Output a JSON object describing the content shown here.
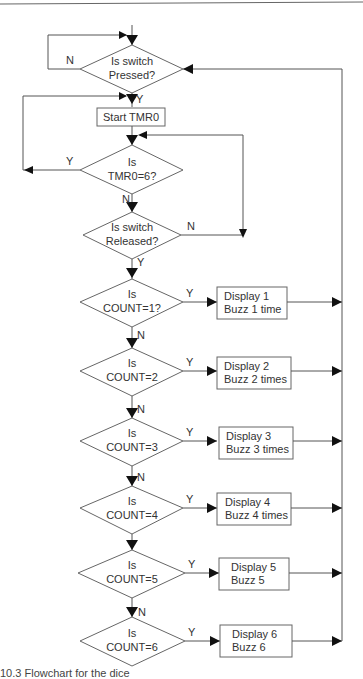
{
  "diagram": {
    "type": "flowchart",
    "nodes": {
      "pressed": {
        "line1": "Is switch",
        "line2": "Pressed?"
      },
      "start_tmr": {
        "label": "Start TMR0"
      },
      "tmr_check": {
        "line1": "Is",
        "line2": "TMR0=6?"
      },
      "released": {
        "line1": "Is switch",
        "line2": "Released?"
      },
      "count1": {
        "line1": "Is",
        "line2": "COUNT=1?"
      },
      "count2": {
        "line1": "Is",
        "line2": "COUNT=2"
      },
      "count3": {
        "line1": "Is",
        "line2": "COUNT=3"
      },
      "count4": {
        "line1": "Is",
        "line2": "COUNT=4"
      },
      "count5": {
        "line1": "Is",
        "line2": "COUNT=5"
      },
      "count6": {
        "line1": "Is",
        "line2": "COUNT=6"
      },
      "action1": {
        "line1": "Display 1",
        "line2": "Buzz 1 time"
      },
      "action2": {
        "line1": "Display 2",
        "line2": "Buzz 2 times"
      },
      "action3": {
        "line1": "Display 3",
        "line2": "Buzz 3 times"
      },
      "action4": {
        "line1": "Display 4",
        "line2": "Buzz 4 times"
      },
      "action5": {
        "line1": "Display 5",
        "line2": "Buzz 5"
      },
      "action6": {
        "line1": "Display 6",
        "line2": "Buzz 6"
      }
    },
    "edge_labels": {
      "yes": "Y",
      "no": "N"
    },
    "caption": "10.3 Flowchart for the dice"
  }
}
